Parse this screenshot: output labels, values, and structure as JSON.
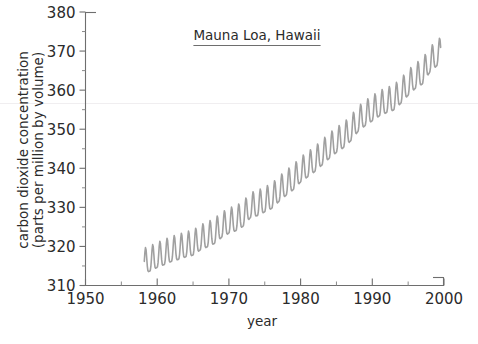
{
  "chart_data": {
    "type": "line",
    "title": "Mauna Loa, Hawaii",
    "xlabel": "year",
    "ylabel_line1": "carbon dioxide concentration",
    "ylabel_line2": "(parts per million by volume)",
    "xlim": [
      1950,
      2000
    ],
    "ylim": [
      310,
      380
    ],
    "x_major_ticks": [
      1950,
      1960,
      1970,
      1980,
      1990,
      2000
    ],
    "x_major_tick_labels": [
      "1950",
      "1960",
      "1970",
      "1980",
      "1990",
      "2000"
    ],
    "x_minor_ticks": [
      1955,
      1965,
      1975,
      1985,
      1995
    ],
    "y_major_ticks": [
      310,
      320,
      330,
      340,
      350,
      360,
      370,
      380
    ],
    "y_major_tick_labels": [
      "310",
      "320",
      "330",
      "340",
      "350",
      "360",
      "370",
      "380"
    ],
    "y_minor_ticks": [
      315,
      325,
      335,
      345,
      355,
      365,
      375
    ],
    "grid": false,
    "legend": "none",
    "series_name": "Atmospheric CO2 (monthly mean)",
    "series_color": "#a0a0a0",
    "seasonal_amplitude_ppm": 3.2,
    "seasonal_peak_month": "May",
    "seasonal_trough_month": "September",
    "annual_means": [
      {
        "year": 1958,
        "co2": 315.3
      },
      {
        "year": 1959,
        "co2": 315.98
      },
      {
        "year": 1960,
        "co2": 316.91
      },
      {
        "year": 1961,
        "co2": 317.64
      },
      {
        "year": 1962,
        "co2": 318.45
      },
      {
        "year": 1963,
        "co2": 318.99
      },
      {
        "year": 1964,
        "co2": 319.62
      },
      {
        "year": 1965,
        "co2": 320.04
      },
      {
        "year": 1966,
        "co2": 321.37
      },
      {
        "year": 1967,
        "co2": 322.18
      },
      {
        "year": 1968,
        "co2": 323.05
      },
      {
        "year": 1969,
        "co2": 324.62
      },
      {
        "year": 1970,
        "co2": 325.68
      },
      {
        "year": 1971,
        "co2": 326.32
      },
      {
        "year": 1972,
        "co2": 327.46
      },
      {
        "year": 1973,
        "co2": 329.68
      },
      {
        "year": 1974,
        "co2": 330.19
      },
      {
        "year": 1975,
        "co2": 331.12
      },
      {
        "year": 1976,
        "co2": 332.03
      },
      {
        "year": 1977,
        "co2": 333.84
      },
      {
        "year": 1978,
        "co2": 335.41
      },
      {
        "year": 1979,
        "co2": 336.84
      },
      {
        "year": 1980,
        "co2": 338.76
      },
      {
        "year": 1981,
        "co2": 340.12
      },
      {
        "year": 1982,
        "co2": 341.48
      },
      {
        "year": 1983,
        "co2": 343.15
      },
      {
        "year": 1984,
        "co2": 344.85
      },
      {
        "year": 1985,
        "co2": 346.35
      },
      {
        "year": 1986,
        "co2": 347.61
      },
      {
        "year": 1987,
        "co2": 349.31
      },
      {
        "year": 1988,
        "co2": 351.69
      },
      {
        "year": 1989,
        "co2": 353.2
      },
      {
        "year": 1990,
        "co2": 354.45
      },
      {
        "year": 1991,
        "co2": 355.7
      },
      {
        "year": 1992,
        "co2": 356.54
      },
      {
        "year": 1993,
        "co2": 357.21
      },
      {
        "year": 1994,
        "co2": 358.96
      },
      {
        "year": 1995,
        "co2": 360.97
      },
      {
        "year": 1996,
        "co2": 362.74
      },
      {
        "year": 1997,
        "co2": 363.88
      },
      {
        "year": 1998,
        "co2": 366.84
      },
      {
        "year": 1999,
        "co2": 368.54
      }
    ],
    "data_start_year": 1958.2,
    "data_end_year": 1999.6,
    "observed_min_ppm": 312.9,
    "observed_max_ppm": 371.2
  }
}
